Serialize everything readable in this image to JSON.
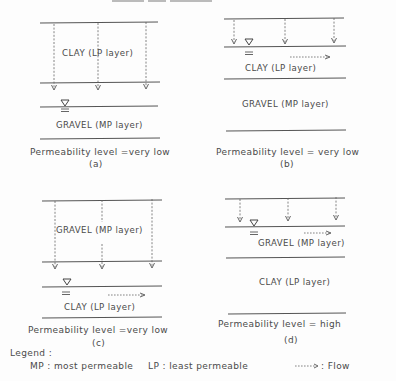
{
  "header_fragment": "(partially cut-off text at top edge, illegible)",
  "panels": [
    {
      "id": "a",
      "label": "(a)",
      "top_layer": "CLAY (LP layer)",
      "bottom_layer": "GRAVEL (MP layer)",
      "water_table": "below top layer",
      "lateral_flow": false,
      "caption": "Permeability level =very low"
    },
    {
      "id": "b",
      "label": "(b)",
      "top_layer": "CLAY (LP layer)",
      "bottom_layer": "GRAVEL (MP layer)",
      "water_table": "at top of clay layer",
      "lateral_flow": true,
      "caption": "Permeability level = very low"
    },
    {
      "id": "c",
      "label": "(c)",
      "top_layer": "GRAVEL (MP layer)",
      "bottom_layer": "CLAY (LP layer)",
      "water_table": "at top of clay layer",
      "lateral_flow": true,
      "caption": "Permeability level =very low"
    },
    {
      "id": "d",
      "label": "(d)",
      "top_layer": "GRAVEL (MP layer)",
      "bottom_layer": "CLAY (LP layer)",
      "water_table": "at top of gravel layer",
      "lateral_flow": true,
      "caption": "Permeability level = high"
    }
  ],
  "legend": {
    "title": "Legend :",
    "items": [
      {
        "key": "MP",
        "text": "MP : most permeable"
      },
      {
        "key": "LP",
        "text": "LP : least permeable"
      },
      {
        "key": "flow",
        "symbol": "------->",
        "text": ": Flow"
      }
    ]
  },
  "colors": {
    "background": "#fdfdfd",
    "ink": "#4a4a4a"
  }
}
